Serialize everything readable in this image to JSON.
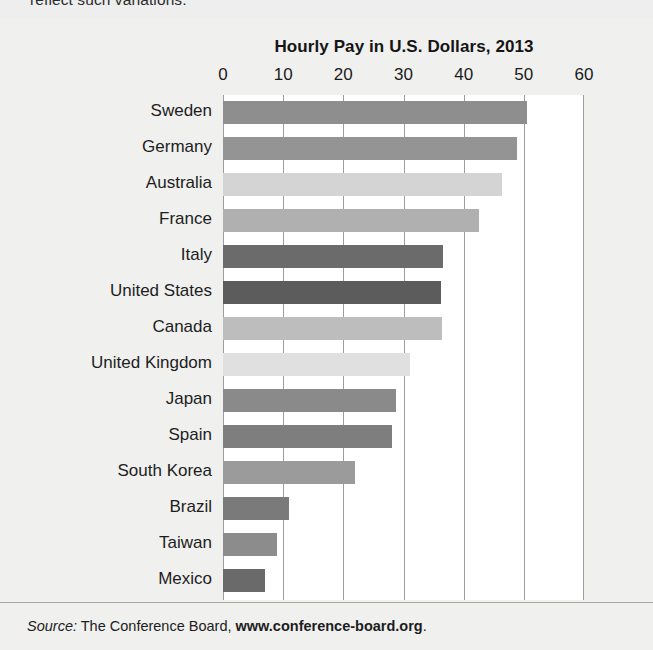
{
  "page": {
    "clipped_top_text": "reflect such variations.",
    "background_color": "#eeeeee"
  },
  "source_note": {
    "label": "Source:",
    "publisher": "The Conference Board,",
    "url": "www.conference-board.org",
    "terminator": "."
  },
  "chart_data": {
    "type": "bar",
    "orientation": "horizontal",
    "title": "Hourly Pay in U.S. Dollars, 2013",
    "xlabel": "",
    "ylabel": "",
    "xlim": [
      0,
      60
    ],
    "xticks": [
      0,
      10,
      20,
      30,
      40,
      50,
      60
    ],
    "xtick_labels": [
      "0",
      "10",
      "20",
      "30",
      "40",
      "50",
      "60"
    ],
    "grid": true,
    "legend": false,
    "categories": [
      "Sweden",
      "Germany",
      "Australia",
      "France",
      "Italy",
      "United States",
      "Canada",
      "United Kingdom",
      "Japan",
      "Spain",
      "South Korea",
      "Brazil",
      "Taiwan",
      "Mexico"
    ],
    "values": [
      50.5,
      48.8,
      46.4,
      42.5,
      36.6,
      36.3,
      36.4,
      31.0,
      28.8,
      28.1,
      21.9,
      10.9,
      9.0,
      6.9
    ],
    "bar_colors": [
      "#8e8e8e",
      "#949494",
      "#d4d4d4",
      "#b0b0b0",
      "#6b6b6b",
      "#5c5c5c",
      "#bdbdbd",
      "#e0e0e0",
      "#8a8a8a",
      "#7e7e7e",
      "#9b9b9b",
      "#7a7a7a",
      "#8c8c8c",
      "#6a6a6a"
    ],
    "plot_background": "#ffffff",
    "gridline_color": "#9d9d9d"
  }
}
